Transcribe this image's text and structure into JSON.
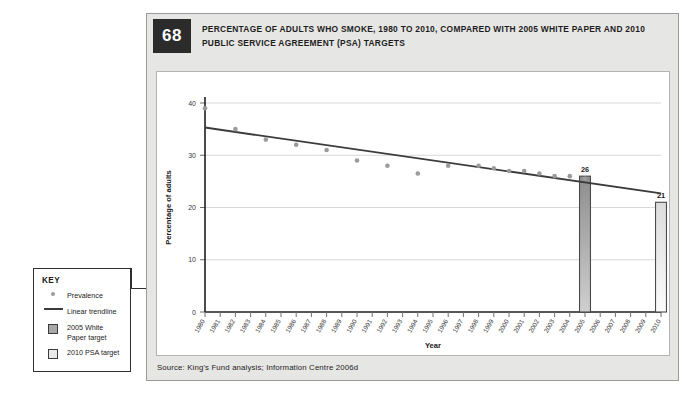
{
  "figure": {
    "number": "68",
    "title": "PERCENTAGE OF ADULTS WHO SMOKE, 1980 TO 2010, COMPARED WITH 2005 WHITE PAPER AND 2010 PUBLIC SERVICE AGREEMENT (PSA) TARGETS",
    "source": "Source: King's Fund analysis; Information Centre 2006d"
  },
  "key": {
    "heading": "KEY",
    "items": [
      {
        "label": "Prevalence",
        "marker": "dot",
        "color": "#9b9b9b"
      },
      {
        "label": "Linear trendline",
        "marker": "line",
        "color": "#3b3b3b"
      },
      {
        "label": "2005 White Paper target",
        "marker": "box-dark",
        "color": "#a8a8a8"
      },
      {
        "label": "2010 PSA target",
        "marker": "box-light",
        "color": "#eaeaea"
      }
    ]
  },
  "chart_data": {
    "type": "scatter",
    "title": "",
    "xlabel": "Year",
    "ylabel": "Percentage of adults",
    "ylim": [
      0,
      40
    ],
    "yticks": [
      0,
      10,
      20,
      30,
      40
    ],
    "grid": "horizontal",
    "legend_position": "external-left",
    "x": [
      1980,
      1981,
      1982,
      1983,
      1984,
      1985,
      1986,
      1987,
      1988,
      1989,
      1990,
      1991,
      1992,
      1993,
      1994,
      1995,
      1996,
      1997,
      1998,
      1999,
      2000,
      2001,
      2002,
      2003,
      2004,
      2005,
      2006,
      2007,
      2008,
      2009,
      2010
    ],
    "categories": [
      "1980",
      "1981",
      "1982",
      "1983",
      "1984",
      "1985",
      "1986",
      "1987",
      "1988",
      "1989",
      "1990",
      "1991",
      "1992",
      "1993",
      "1994",
      "1995",
      "1996",
      "1997",
      "1998",
      "1999",
      "2000",
      "2001",
      "2002",
      "2003",
      "2004",
      "2005",
      "2006",
      "2007",
      "2008",
      "2009",
      "2010"
    ],
    "series": [
      {
        "name": "Prevalence",
        "type": "scatter",
        "color": "#9b9b9b",
        "points": [
          {
            "x": 1980,
            "y": 39
          },
          {
            "x": 1982,
            "y": 35
          },
          {
            "x": 1984,
            "y": 33
          },
          {
            "x": 1986,
            "y": 32
          },
          {
            "x": 1988,
            "y": 31
          },
          {
            "x": 1990,
            "y": 29
          },
          {
            "x": 1992,
            "y": 28
          },
          {
            "x": 1994,
            "y": 26.5
          },
          {
            "x": 1996,
            "y": 28
          },
          {
            "x": 1998,
            "y": 28
          },
          {
            "x": 1999,
            "y": 27.5
          },
          {
            "x": 2000,
            "y": 27
          },
          {
            "x": 2001,
            "y": 27
          },
          {
            "x": 2002,
            "y": 26.5
          },
          {
            "x": 2003,
            "y": 26
          },
          {
            "x": 2004,
            "y": 26
          },
          {
            "x": 2005,
            "y": 25.5
          }
        ]
      },
      {
        "name": "Linear trendline",
        "type": "line",
        "color": "#3b3b3b",
        "start": {
          "x": 1980,
          "y": 35.3
        },
        "end": {
          "x": 2010,
          "y": 22.7
        }
      },
      {
        "name": "2005 White Paper target",
        "type": "bar",
        "color": "#a8a8a8",
        "bars": [
          {
            "x": 2005,
            "y": 26,
            "label": "26"
          }
        ]
      },
      {
        "name": "2010 PSA target",
        "type": "bar",
        "color": "#eaeaea",
        "bars": [
          {
            "x": 2010,
            "y": 21,
            "label": "21"
          }
        ]
      }
    ]
  }
}
